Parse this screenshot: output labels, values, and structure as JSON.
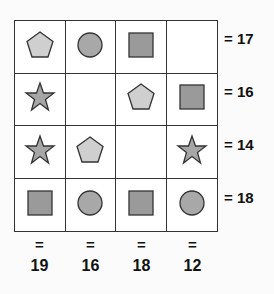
{
  "puzzle": {
    "colors": {
      "pentagon": "#cfcfcf",
      "circle": "#a8a8a8",
      "square": "#9a9a9a",
      "star": "#a6a6a6",
      "outline": "#333333"
    },
    "grid": [
      [
        "pentagon",
        "circle",
        "square",
        "empty"
      ],
      [
        "star",
        "empty",
        "pentagon",
        "square"
      ],
      [
        "star",
        "pentagon",
        "empty",
        "star"
      ],
      [
        "square",
        "circle",
        "square",
        "circle"
      ]
    ],
    "row_sums": [
      {
        "eq": "=",
        "value": "17",
        "label": "= 17"
      },
      {
        "eq": "=",
        "value": "16",
        "label": "= 16"
      },
      {
        "eq": "=",
        "value": "14",
        "label": "= 14"
      },
      {
        "eq": "=",
        "value": "18",
        "label": "= 18"
      }
    ],
    "col_sums": [
      {
        "eq": "=",
        "value": "19"
      },
      {
        "eq": "=",
        "value": "16"
      },
      {
        "eq": "=",
        "value": "18"
      },
      {
        "eq": "=",
        "value": "12"
      }
    ]
  }
}
